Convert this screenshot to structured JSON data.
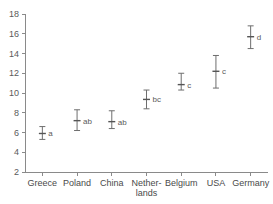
{
  "chart_data": {
    "type": "scatter",
    "title": "",
    "subtitle": "",
    "xlabel": "",
    "ylabel": "",
    "ylim": [
      2,
      18
    ],
    "yticks": [
      2,
      4,
      6,
      8,
      10,
      12,
      14,
      16,
      18
    ],
    "ytick_labels": [
      "2",
      "4",
      "6",
      "8",
      "10",
      "12",
      "14",
      "16",
      "18"
    ],
    "grid": false,
    "legend": "none",
    "error_bar_style": "mean with capped confidence interval",
    "annotation_note": "letters denote significance groupings",
    "categories": [
      "Greece",
      "Poland",
      "China",
      "Netherlands",
      "Belgium",
      "USA",
      "Germany"
    ],
    "category_display": [
      {
        "line1": "Greece",
        "line2": ""
      },
      {
        "line1": "Poland",
        "line2": ""
      },
      {
        "line1": "China",
        "line2": ""
      },
      {
        "line1": "Nether-",
        "line2": "lands"
      },
      {
        "line1": "Belgium",
        "line2": ""
      },
      {
        "line1": "USA",
        "line2": ""
      },
      {
        "line1": "Germany",
        "line2": ""
      }
    ],
    "values": [
      5.9,
      7.2,
      7.1,
      9.35,
      10.85,
      12.2,
      15.7
    ],
    "lower": [
      5.3,
      6.2,
      6.4,
      8.4,
      10.3,
      10.5,
      14.5
    ],
    "upper": [
      6.6,
      8.3,
      8.2,
      10.3,
      12.0,
      13.8,
      16.8
    ],
    "group_labels": [
      "a",
      "ab",
      "ab",
      "bc",
      "c",
      "c",
      "d"
    ],
    "colors": {
      "axis": "#8a8a8a",
      "marker": "#555555",
      "error_bar": "#6e6e6e",
      "text": "#4a4a4a",
      "background": "#ffffff"
    }
  }
}
